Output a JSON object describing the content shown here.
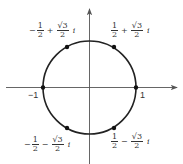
{
  "diagram": {
    "colors": {
      "stroke": "#222222",
      "axis": "#555555",
      "text": "#333333"
    },
    "geometry": {
      "cx": 89.5,
      "cy": 87.5,
      "r": 46.5
    },
    "axis_labels": {
      "neg_one": "−1",
      "pos_one": "1"
    },
    "points": [
      {
        "id": "upper-left",
        "x": 67,
        "y": 47,
        "real_sign": "−",
        "real_num": "1",
        "real_den": "2",
        "op": "+",
        "imag_num": "√3",
        "imag_den": "2",
        "imag_unit": "i"
      },
      {
        "id": "upper-right",
        "x": 114,
        "y": 47,
        "real_sign": "",
        "real_num": "1",
        "real_den": "2",
        "op": "+",
        "imag_num": "√3",
        "imag_den": "2",
        "imag_unit": "i"
      },
      {
        "id": "left",
        "x": 43,
        "y": 87.5
      },
      {
        "id": "right",
        "x": 136,
        "y": 87.5
      },
      {
        "id": "lower-left",
        "x": 67,
        "y": 128,
        "real_sign": "−",
        "real_num": "1",
        "real_den": "2",
        "op": "−",
        "imag_num": "√3",
        "imag_den": "2",
        "imag_unit": "i"
      },
      {
        "id": "lower-right",
        "x": 114,
        "y": 128,
        "real_sign": "",
        "real_num": "1",
        "real_den": "2",
        "op": "−",
        "imag_num": "√3",
        "imag_den": "2",
        "imag_unit": "i"
      }
    ]
  }
}
